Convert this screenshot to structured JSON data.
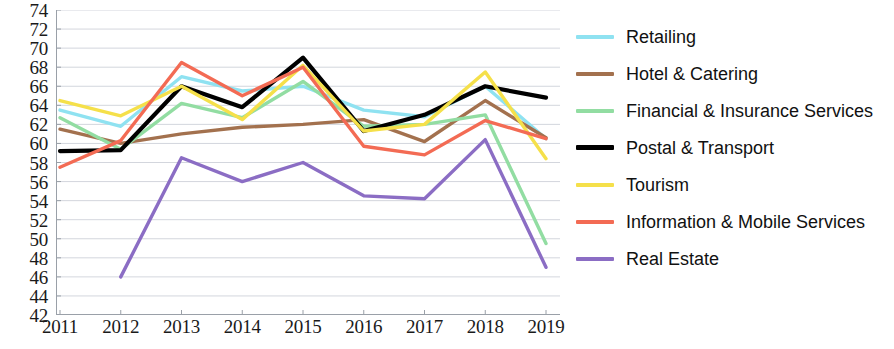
{
  "chart_data": {
    "type": "line",
    "title": "",
    "xlabel": "",
    "ylabel": "",
    "categories": [
      "2011",
      "2012",
      "2013",
      "2014",
      "2015",
      "2016",
      "2017",
      "2018",
      "2019"
    ],
    "ylim": [
      42,
      74
    ],
    "y_ticks": [
      42,
      44,
      46,
      48,
      50,
      52,
      54,
      56,
      58,
      60,
      62,
      64,
      66,
      68,
      70,
      72,
      74
    ],
    "grid": true,
    "legend_position": "right",
    "series": [
      {
        "name": "Retailing",
        "color": "#8FE2F1",
        "values": [
          63.5,
          61.8,
          67.0,
          65.5,
          66.0,
          63.5,
          62.8,
          66.0,
          60.5
        ]
      },
      {
        "name": "Hotel & Catering",
        "color": "#A3714E",
        "values": [
          61.5,
          60.0,
          61.0,
          61.7,
          62.0,
          62.5,
          60.2,
          64.5,
          60.6
        ]
      },
      {
        "name": "Financial & Insurance Services",
        "color": "#92DDA2",
        "values": [
          62.7,
          59.4,
          64.2,
          62.7,
          66.5,
          61.8,
          62.0,
          63.0,
          49.5
        ]
      },
      {
        "name": "Postal & Transport",
        "color": "#000000",
        "values": [
          59.2,
          59.3,
          66.0,
          63.8,
          69.0,
          61.3,
          63.0,
          66.0,
          64.8
        ]
      },
      {
        "name": "Tourism",
        "color": "#F5E04A",
        "values": [
          64.5,
          62.9,
          66.0,
          62.5,
          68.2,
          61.3,
          62.0,
          67.5,
          58.4
        ]
      },
      {
        "name": "Information & Mobile Services",
        "color": "#F36B54",
        "values": [
          57.5,
          60.3,
          68.5,
          65.0,
          68.0,
          59.7,
          58.8,
          62.4,
          60.5
        ]
      },
      {
        "name": "Real Estate",
        "color": "#8B6DC4",
        "values": [
          null,
          46.0,
          58.5,
          56.0,
          58.0,
          54.5,
          54.2,
          60.4,
          47.0
        ]
      }
    ]
  }
}
